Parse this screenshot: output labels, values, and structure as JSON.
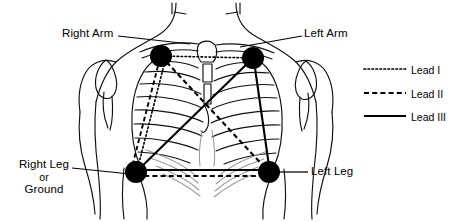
{
  "diagram": {
    "colors": {
      "ink": "#000000",
      "anatomy_outline": "#1a1a1a",
      "anatomy_light": "#8a8a8a",
      "background": "#ffffff"
    },
    "electrodes": [
      {
        "id": "right-arm",
        "label": "Right Arm",
        "x": 161,
        "y": 56,
        "r": 11
      },
      {
        "id": "left-arm",
        "label": "Left Arm",
        "x": 253,
        "y": 58,
        "r": 11
      },
      {
        "id": "right-leg",
        "label": "Right Leg",
        "x": 136,
        "y": 172,
        "r": 11
      },
      {
        "id": "left-leg",
        "label": "Left Leg",
        "x": 269,
        "y": 172,
        "r": 11
      }
    ],
    "labels": {
      "right_arm": "Right Arm",
      "left_arm": "Left Arm",
      "left_leg": "Left Leg",
      "right_leg_line1": "Right Leg",
      "right_leg_line2": "or",
      "right_leg_line3": "Ground"
    },
    "leads": [
      {
        "id": "lead-1",
        "name": "Lead I",
        "style": "dotted",
        "from": "right-arm",
        "to": "left-arm"
      },
      {
        "id": "lead-2",
        "name": "Lead II",
        "style": "dashed",
        "from": "right-arm",
        "to": "left-leg"
      },
      {
        "id": "lead-3",
        "name": "Lead III",
        "style": "solid",
        "from": "left-arm",
        "to": "right-leg"
      },
      {
        "id": "lead-1b",
        "name": "Lead I",
        "style": "dotted",
        "from": "right-arm",
        "to": "right-leg"
      },
      {
        "id": "lead-2b",
        "name": "Lead II",
        "style": "dashed",
        "from": "right-arm",
        "to": "right-leg"
      },
      {
        "id": "lead-2c",
        "name": "Lead II",
        "style": "dashed",
        "from": "right-leg",
        "to": "left-leg"
      },
      {
        "id": "lead-3b",
        "name": "Lead III",
        "style": "solid",
        "from": "left-arm",
        "to": "left-leg"
      },
      {
        "id": "lead-3c",
        "name": "Lead III",
        "style": "solid",
        "from": "right-leg",
        "to": "left-leg"
      }
    ],
    "legend": {
      "items": [
        {
          "label": "Lead I",
          "style": "dotted"
        },
        {
          "label": "Lead II",
          "style": "dashed"
        },
        {
          "label": "Lead III",
          "style": "solid"
        }
      ]
    }
  }
}
